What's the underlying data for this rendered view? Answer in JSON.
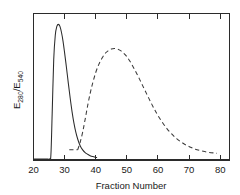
{
  "chart_data": {
    "type": "line",
    "title": "",
    "xlabel": "Fraction Number",
    "ylabel": "E280/E540",
    "ylabel_parts": {
      "e1": "E",
      "sub1": "280",
      "slash": "/E",
      "sub2": "540"
    },
    "xlim": [
      20,
      83
    ],
    "ylim": [
      0,
      1.08
    ],
    "grid": false,
    "legend": "none",
    "xticks": [
      20,
      30,
      40,
      50,
      60,
      70,
      80
    ],
    "xtick_labels": [
      "20",
      "30",
      "40",
      "50",
      "60",
      "70",
      "80"
    ],
    "yticks": [],
    "ytick_labels": [],
    "tick_direction": "in",
    "axis_frame": "box",
    "series": [
      {
        "name": "solid-peak",
        "style": "solid",
        "color": "#2b2b2b",
        "x": [
          20.0,
          22.0,
          24.0,
          25.2,
          25.6,
          26.0,
          26.5,
          27.0,
          27.5,
          28.0,
          28.5,
          29.0,
          29.5,
          30.0,
          30.6,
          31.2,
          31.8,
          32.4,
          33.0,
          33.6,
          34.2,
          35.0,
          35.8,
          36.6,
          37.4,
          38.2,
          39.0,
          39.8,
          40.3
        ],
        "y": [
          0.008,
          0.008,
          0.008,
          0.008,
          0.04,
          0.34,
          0.74,
          0.92,
          0.985,
          1.0,
          0.985,
          0.94,
          0.875,
          0.79,
          0.68,
          0.565,
          0.455,
          0.355,
          0.272,
          0.205,
          0.155,
          0.105,
          0.075,
          0.055,
          0.042,
          0.032,
          0.025,
          0.02,
          0.018
        ]
      },
      {
        "name": "dashed-peak",
        "style": "dashed",
        "color": "#3a3a3a",
        "x": [
          34.2,
          35.0,
          35.8,
          36.6,
          37.4,
          38.2,
          39.0,
          40.0,
          41.0,
          42.0,
          43.0,
          44.0,
          45.0,
          46.0,
          47.0,
          48.0,
          49.0,
          50.0,
          51.0,
          52.0,
          53.0,
          54.0,
          55.0,
          56.0,
          57.0,
          58.0,
          59.0,
          60.0,
          61.5,
          63.0,
          64.5,
          66.0,
          67.5,
          69.0,
          70.5,
          72.0,
          73.5,
          75.0,
          76.5,
          78.0,
          79.0
        ],
        "y": [
          0.075,
          0.13,
          0.205,
          0.3,
          0.4,
          0.49,
          0.565,
          0.645,
          0.705,
          0.75,
          0.785,
          0.805,
          0.818,
          0.822,
          0.818,
          0.806,
          0.787,
          0.762,
          0.728,
          0.688,
          0.645,
          0.6,
          0.552,
          0.505,
          0.458,
          0.412,
          0.368,
          0.328,
          0.275,
          0.228,
          0.19,
          0.158,
          0.132,
          0.11,
          0.094,
          0.08,
          0.07,
          0.062,
          0.056,
          0.052,
          0.05
        ]
      },
      {
        "name": "dashed-baseline-stub",
        "style": "dashed",
        "color": "#3a3a3a",
        "x": [
          31.5,
          34.2
        ],
        "y": [
          0.075,
          0.075
        ]
      }
    ],
    "annotations": [
      {
        "name": "solid-curve-peak",
        "x": 28,
        "label": "peak of solid elution profile"
      },
      {
        "name": "dashed-curve-peak",
        "x": 46,
        "label": "peak of dashed elution profile"
      }
    ]
  }
}
